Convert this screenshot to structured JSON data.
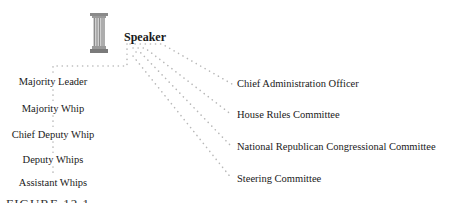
{
  "diagram": {
    "root": {
      "label": "Speaker",
      "icon": "pillar-icon"
    },
    "left_chain": [
      {
        "label": "Majority Leader"
      },
      {
        "label": "Majority Whip"
      },
      {
        "label": "Chief Deputy Whip"
      },
      {
        "label": "Deputy Whips"
      },
      {
        "label": "Assistant Whips"
      }
    ],
    "right_branches": [
      {
        "label": "Chief Administration Officer"
      },
      {
        "label": "House Rules Committee"
      },
      {
        "label": "National Republican Congressional Committee"
      },
      {
        "label": "Steering Committee"
      }
    ],
    "caption": "FIGURE 12.1",
    "colors": {
      "connector": "#b8b8b8",
      "text": "#1a1a1a",
      "pillar": "#8a8a8a"
    }
  }
}
